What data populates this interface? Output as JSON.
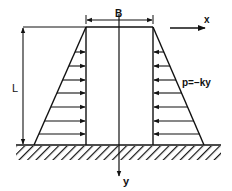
{
  "diagram": {
    "labels": {
      "width": "B",
      "height": "L",
      "x_axis": "x",
      "y_axis": "y",
      "pressure": "p=−ky"
    },
    "colors": {
      "line": "#111111",
      "background": "#ffffff"
    },
    "geometry": {
      "top_left_x": 86,
      "top_right_x": 153,
      "top_y": 27,
      "base_left_x": 34,
      "base_right_x": 204,
      "ground_y": 145,
      "center_x": 119,
      "arrow_rows_y": [
        52,
        66,
        80,
        93,
        107,
        121,
        134
      ]
    }
  }
}
